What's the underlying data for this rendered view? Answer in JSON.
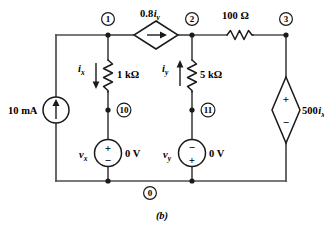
{
  "figure": {
    "caption": "(b)",
    "type": "circuit-schematic"
  },
  "nodes": [
    {
      "id": "node-1",
      "label": "1"
    },
    {
      "id": "node-2",
      "label": "2"
    },
    {
      "id": "node-3",
      "label": "3"
    },
    {
      "id": "node-10",
      "label": "10"
    },
    {
      "id": "node-11",
      "label": "11"
    },
    {
      "id": "node-0",
      "label": "0"
    }
  ],
  "components": {
    "current_source": {
      "name": "independent-current-source",
      "label": "10 mA",
      "direction": "up"
    },
    "dependent_current_source": {
      "name": "dependent-current-source",
      "coefficient": "0.8",
      "variable": "i",
      "subscript": "y",
      "direction": "right"
    },
    "resistor_1k": {
      "name": "resistor-1k",
      "label": "1 kΩ"
    },
    "resistor_5k": {
      "name": "resistor-5k",
      "label": "5 kΩ"
    },
    "resistor_100": {
      "name": "resistor-100",
      "label": "100 Ω"
    },
    "current_ix": {
      "name": "current-ix",
      "variable": "i",
      "subscript": "x",
      "direction": "down"
    },
    "current_iy": {
      "name": "current-iy",
      "variable": "i",
      "subscript": "y",
      "direction": "up"
    },
    "vsource_vx": {
      "name": "voltage-source-vx",
      "variable": "v",
      "subscript": "x",
      "value": "0 V",
      "top_sign": "+",
      "bottom_sign": "−"
    },
    "vsource_vy": {
      "name": "voltage-source-vy",
      "variable": "v",
      "subscript": "y",
      "value": "0 V",
      "top_sign": "−",
      "bottom_sign": "+"
    },
    "dependent_voltage_source": {
      "name": "dependent-voltage-source",
      "coefficient": "500",
      "variable": "i",
      "subscript": "x",
      "top_sign": "+",
      "bottom_sign": "−"
    }
  },
  "colors": {
    "wire": "#4d4d4d",
    "component": "#1a1a1a",
    "background": "#ffffff"
  }
}
